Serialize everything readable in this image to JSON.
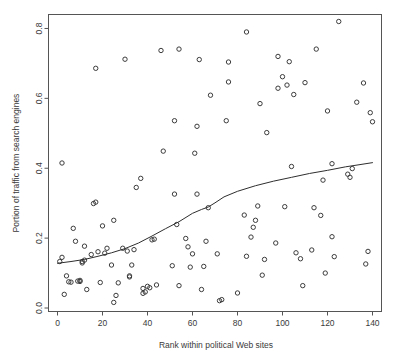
{
  "chart_data": {
    "type": "scatter",
    "title": "",
    "xlabel": "Rank within political Web sites",
    "ylabel": "Portion of traffic from search engines",
    "xlim": [
      -4,
      144
    ],
    "ylim": [
      -0.01,
      0.84
    ],
    "xticks": [
      0,
      20,
      40,
      60,
      80,
      100,
      120,
      140
    ],
    "xticklabels": [
      "0",
      "20",
      "40",
      "60",
      "80",
      "100",
      "120",
      "140"
    ],
    "yticks": [
      0.0,
      0.2,
      0.4,
      0.6,
      0.8
    ],
    "yticklabels": [
      "0.0",
      "0.2",
      "0.4",
      "0.6",
      "0.8"
    ],
    "grid": false,
    "legend": null,
    "marker": "open-circle",
    "marker_color": "#3c3c3c",
    "points": [
      [
        1,
        0.133
      ],
      [
        2,
        0.145
      ],
      [
        2,
        0.415
      ],
      [
        3,
        0.039
      ],
      [
        4,
        0.092
      ],
      [
        5,
        0.075
      ],
      [
        6,
        0.074
      ],
      [
        7,
        0.228
      ],
      [
        8,
        0.191
      ],
      [
        9,
        0.077
      ],
      [
        10,
        0.079
      ],
      [
        10,
        0.076
      ],
      [
        11,
        0.133
      ],
      [
        11,
        0.129
      ],
      [
        12,
        0.137
      ],
      [
        12,
        0.177
      ],
      [
        13,
        0.053
      ],
      [
        15,
        0.153
      ],
      [
        16,
        0.299
      ],
      [
        17,
        0.303
      ],
      [
        17,
        0.686
      ],
      [
        18,
        0.161
      ],
      [
        19,
        0.073
      ],
      [
        20,
        0.235
      ],
      [
        21,
        0.157
      ],
      [
        22,
        0.171
      ],
      [
        24,
        0.123
      ],
      [
        25,
        0.016
      ],
      [
        25,
        0.251
      ],
      [
        26,
        0.036
      ],
      [
        27,
        0.072
      ],
      [
        29,
        0.171
      ],
      [
        30,
        0.712
      ],
      [
        31,
        0.163
      ],
      [
        32,
        0.089
      ],
      [
        32,
        0.092
      ],
      [
        33,
        0.123
      ],
      [
        34,
        0.167
      ],
      [
        35,
        0.345
      ],
      [
        37,
        0.371
      ],
      [
        38,
        0.056
      ],
      [
        38,
        0.042
      ],
      [
        39,
        0.046
      ],
      [
        40,
        0.062
      ],
      [
        41,
        0.058
      ],
      [
        42,
        0.195
      ],
      [
        43,
        0.197
      ],
      [
        44,
        0.066
      ],
      [
        46,
        0.737
      ],
      [
        47,
        0.449
      ],
      [
        51,
        0.121
      ],
      [
        52,
        0.326
      ],
      [
        52,
        0.536
      ],
      [
        53,
        0.239
      ],
      [
        54,
        0.064
      ],
      [
        54,
        0.741
      ],
      [
        57,
        0.199
      ],
      [
        58,
        0.175
      ],
      [
        59,
        0.117
      ],
      [
        60,
        0.155
      ],
      [
        61,
        0.443
      ],
      [
        62,
        0.52
      ],
      [
        62,
        0.326
      ],
      [
        63,
        0.711
      ],
      [
        64,
        0.053
      ],
      [
        65,
        0.119
      ],
      [
        66,
        0.191
      ],
      [
        67,
        0.287
      ],
      [
        68,
        0.609
      ],
      [
        71,
        0.155
      ],
      [
        72,
        0.021
      ],
      [
        73,
        0.024
      ],
      [
        75,
        0.536
      ],
      [
        76,
        0.704
      ],
      [
        76,
        0.647
      ],
      [
        80,
        0.043
      ],
      [
        83,
        0.266
      ],
      [
        84,
        0.148
      ],
      [
        84,
        0.79
      ],
      [
        86,
        0.203
      ],
      [
        87,
        0.231
      ],
      [
        88,
        0.251
      ],
      [
        89,
        0.292
      ],
      [
        90,
        0.585
      ],
      [
        91,
        0.094
      ],
      [
        92,
        0.139
      ],
      [
        93,
        0.502
      ],
      [
        97,
        0.186
      ],
      [
        98,
        0.629
      ],
      [
        98,
        0.72
      ],
      [
        100,
        0.662
      ],
      [
        101,
        0.29
      ],
      [
        102,
        0.638
      ],
      [
        103,
        0.705
      ],
      [
        104,
        0.405
      ],
      [
        105,
        0.611
      ],
      [
        106,
        0.158
      ],
      [
        108,
        0.141
      ],
      [
        109,
        0.064
      ],
      [
        110,
        0.645
      ],
      [
        113,
        0.166
      ],
      [
        114,
        0.287
      ],
      [
        115,
        0.741
      ],
      [
        117,
        0.265
      ],
      [
        118,
        0.366
      ],
      [
        119,
        0.1
      ],
      [
        120,
        0.564
      ],
      [
        122,
        0.204
      ],
      [
        122,
        0.413
      ],
      [
        123,
        0.147
      ],
      [
        125,
        0.82
      ],
      [
        129,
        0.383
      ],
      [
        130,
        0.374
      ],
      [
        131,
        0.399
      ],
      [
        133,
        0.589
      ],
      [
        136,
        0.644
      ],
      [
        137,
        0.126
      ],
      [
        138,
        0.162
      ],
      [
        139,
        0.559
      ],
      [
        140,
        0.533
      ]
    ],
    "smooth": {
      "name": "lowess",
      "x": [
        0,
        6,
        12,
        18,
        24,
        30,
        36,
        42,
        48,
        54,
        60,
        64,
        67,
        70,
        74,
        80,
        88,
        96,
        104,
        112,
        120,
        128,
        134,
        140
      ],
      "y": [
        0.128,
        0.133,
        0.139,
        0.148,
        0.158,
        0.17,
        0.186,
        0.206,
        0.227,
        0.247,
        0.271,
        0.282,
        0.289,
        0.301,
        0.318,
        0.334,
        0.35,
        0.363,
        0.374,
        0.385,
        0.394,
        0.404,
        0.41,
        0.416
      ]
    }
  },
  "figure": {
    "background": "#ffffff",
    "frame_color": "#555555"
  }
}
